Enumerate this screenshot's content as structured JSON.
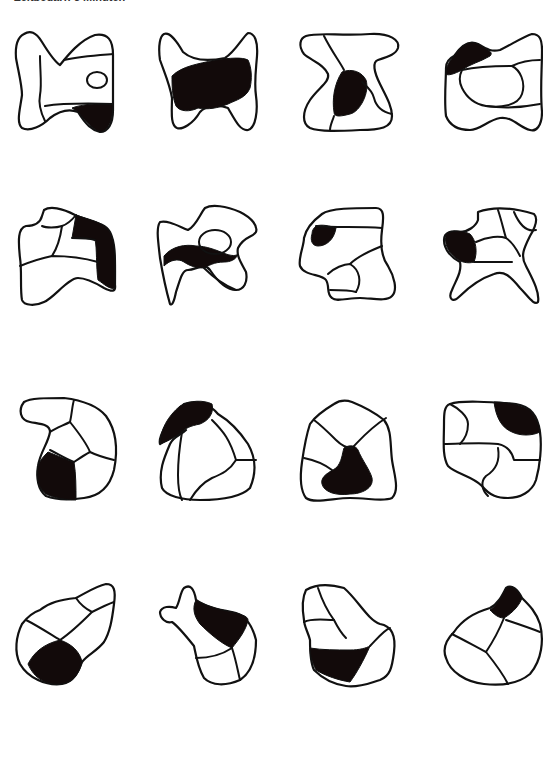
{
  "header": {
    "text": "Zeitbedarf: 3 Minuten"
  },
  "figures": {
    "count": 16,
    "rows": 4,
    "columns": 4,
    "colors": {
      "stroke": "#111111",
      "fill": "#ffffff",
      "shaded": "#120a0a"
    },
    "items": [
      {
        "id": 1,
        "row": 1,
        "col": 1,
        "shaded_region": "bottom-right"
      },
      {
        "id": 2,
        "row": 1,
        "col": 2,
        "shaded_region": "center"
      },
      {
        "id": 3,
        "row": 1,
        "col": 3,
        "shaded_region": "center"
      },
      {
        "id": 4,
        "row": 1,
        "col": 4,
        "shaded_region": "top-left"
      },
      {
        "id": 5,
        "row": 2,
        "col": 1,
        "shaded_region": "right"
      },
      {
        "id": 6,
        "row": 2,
        "col": 2,
        "shaded_region": "middle-band"
      },
      {
        "id": 7,
        "row": 2,
        "col": 3,
        "shaded_region": "left"
      },
      {
        "id": 8,
        "row": 2,
        "col": 4,
        "shaded_region": "left"
      },
      {
        "id": 9,
        "row": 3,
        "col": 1,
        "shaded_region": "bottom-left"
      },
      {
        "id": 10,
        "row": 3,
        "col": 2,
        "shaded_region": "top-left"
      },
      {
        "id": 11,
        "row": 3,
        "col": 3,
        "shaded_region": "bottom-center"
      },
      {
        "id": 12,
        "row": 3,
        "col": 4,
        "shaded_region": "top-right"
      },
      {
        "id": 13,
        "row": 4,
        "col": 1,
        "shaded_region": "bottom-left"
      },
      {
        "id": 14,
        "row": 4,
        "col": 2,
        "shaded_region": "top-right"
      },
      {
        "id": 15,
        "row": 4,
        "col": 3,
        "shaded_region": "bottom-left"
      },
      {
        "id": 16,
        "row": 4,
        "col": 4,
        "shaded_region": "top"
      }
    ]
  }
}
